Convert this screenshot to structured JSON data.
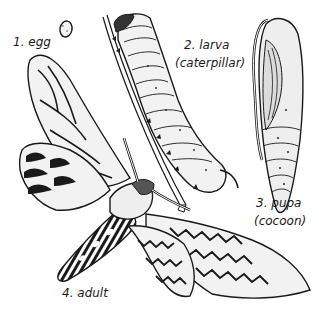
{
  "diagram": {
    "stages": [
      {
        "number": "1.",
        "name": "egg",
        "sub": ""
      },
      {
        "number": "2.",
        "name": "larva",
        "sub": "(caterpillar)"
      },
      {
        "number": "3.",
        "name": "pupa",
        "sub": "(cocoon)"
      },
      {
        "number": "4.",
        "name": "adult",
        "sub": ""
      }
    ],
    "colors": {
      "ink": "#1a1a1a",
      "paper": "#ffffff",
      "shade": "#cfcfcf"
    }
  }
}
